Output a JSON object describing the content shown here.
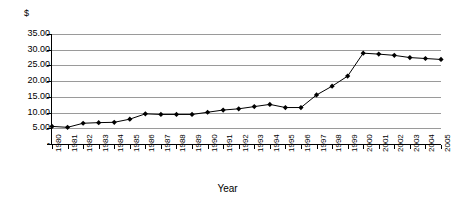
{
  "chart_data": {
    "type": "line",
    "title": "",
    "subtitle": "",
    "xlabel": "Year",
    "ylabel": "$",
    "ylim": [
      0,
      35
    ],
    "grid": true,
    "legend": false,
    "ytick_labels": [
      "35.00",
      "30.00",
      "25.00",
      "20.00",
      "15.00",
      "10.00",
      "5.00",
      "-"
    ],
    "ytick_values": [
      35,
      30,
      25,
      20,
      15,
      10,
      5,
      0
    ],
    "categories": [
      "1980",
      "1981",
      "1982",
      "1983",
      "1984",
      "1985",
      "1986",
      "1987",
      "1988",
      "1989",
      "1990",
      "1991",
      "1992",
      "1993",
      "1994",
      "1995",
      "1996",
      "1997",
      "1998",
      "1999",
      "2000",
      "2001",
      "2002",
      "2003",
      "2004",
      "2005"
    ],
    "series": [
      {
        "name": "Price",
        "marker": "diamond",
        "color": "#000000",
        "values": [
          5.6,
          5.3,
          6.6,
          6.8,
          6.9,
          7.9,
          9.6,
          9.4,
          9.4,
          9.4,
          10.1,
          10.8,
          11.2,
          11.9,
          12.6,
          11.6,
          11.6,
          15.6,
          18.4,
          21.6,
          28.9,
          28.6,
          28.2,
          27.5,
          27.2,
          26.9
        ]
      }
    ]
  },
  "axis": {
    "currency_symbol": "$",
    "x_title": "Year"
  }
}
